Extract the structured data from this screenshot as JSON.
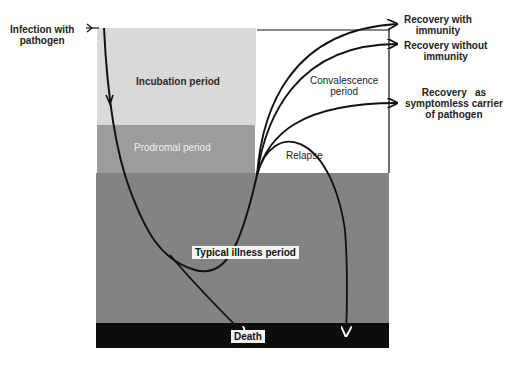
{
  "diagram": {
    "start_label": [
      "Infection with",
      "pathogen"
    ],
    "periods": {
      "incubation": "Incubation period",
      "prodromal": "Prodromal period",
      "typical_illness": "Typical illness period",
      "convalescence": [
        "Convalescence",
        "period"
      ],
      "death": "Death"
    },
    "outcomes": {
      "recovery_immunity": [
        "Recovery with",
        "immunity"
      ],
      "recovery_no_immunity": [
        "Recovery without",
        "immunity"
      ],
      "recovery_carrier": [
        "Recovery   as",
        "symptomless carrier",
        "of pathogen"
      ],
      "relapse": "Relapse"
    },
    "colors": {
      "incubation": "#d9d9d9",
      "prodromal": "#9c9c9c",
      "typical_illness": "#838383",
      "death": "#0d0d0d",
      "line": "#111111"
    }
  }
}
